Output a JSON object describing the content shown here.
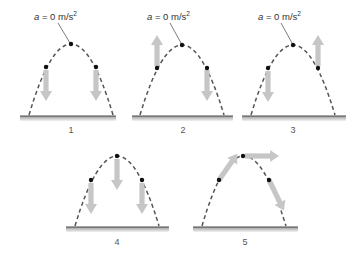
{
  "diagram": {
    "colors": {
      "trajectory": "#555555",
      "point": "#111111",
      "arrow": "#c6c6c6",
      "ground_line": "#4a4a4a",
      "ground_fill": "#c4c4c4",
      "text": "#333333"
    },
    "panels": [
      {
        "id": "1",
        "label": "1",
        "annotation": "a = 0 m/s²",
        "annotation_var": "a",
        "annotation_rest": " = 0 m/s",
        "annotation_sup": "2",
        "arrows": [
          {
            "at": "left-point",
            "direction": "down"
          },
          {
            "at": "right-point",
            "direction": "down"
          }
        ]
      },
      {
        "id": "2",
        "label": "2",
        "annotation": "a = 0 m/s²",
        "annotation_var": "a",
        "annotation_rest": " = 0 m/s",
        "annotation_sup": "2",
        "arrows": [
          {
            "at": "left-point",
            "direction": "up"
          },
          {
            "at": "right-point",
            "direction": "down"
          }
        ]
      },
      {
        "id": "3",
        "label": "3",
        "annotation": "a = 0 m/s²",
        "annotation_var": "a",
        "annotation_rest": " = 0 m/s",
        "annotation_sup": "2",
        "arrows": [
          {
            "at": "left-point",
            "direction": "down"
          },
          {
            "at": "right-point",
            "direction": "up"
          }
        ]
      },
      {
        "id": "4",
        "label": "4",
        "arrows": [
          {
            "at": "left-point",
            "direction": "down"
          },
          {
            "at": "top-point",
            "direction": "down"
          },
          {
            "at": "right-point",
            "direction": "down"
          }
        ]
      },
      {
        "id": "5",
        "label": "5",
        "arrows": [
          {
            "at": "left-point",
            "direction": "tangent-up-right"
          },
          {
            "at": "top-point",
            "direction": "right"
          },
          {
            "at": "right-point",
            "direction": "tangent-down-right"
          }
        ]
      }
    ]
  }
}
